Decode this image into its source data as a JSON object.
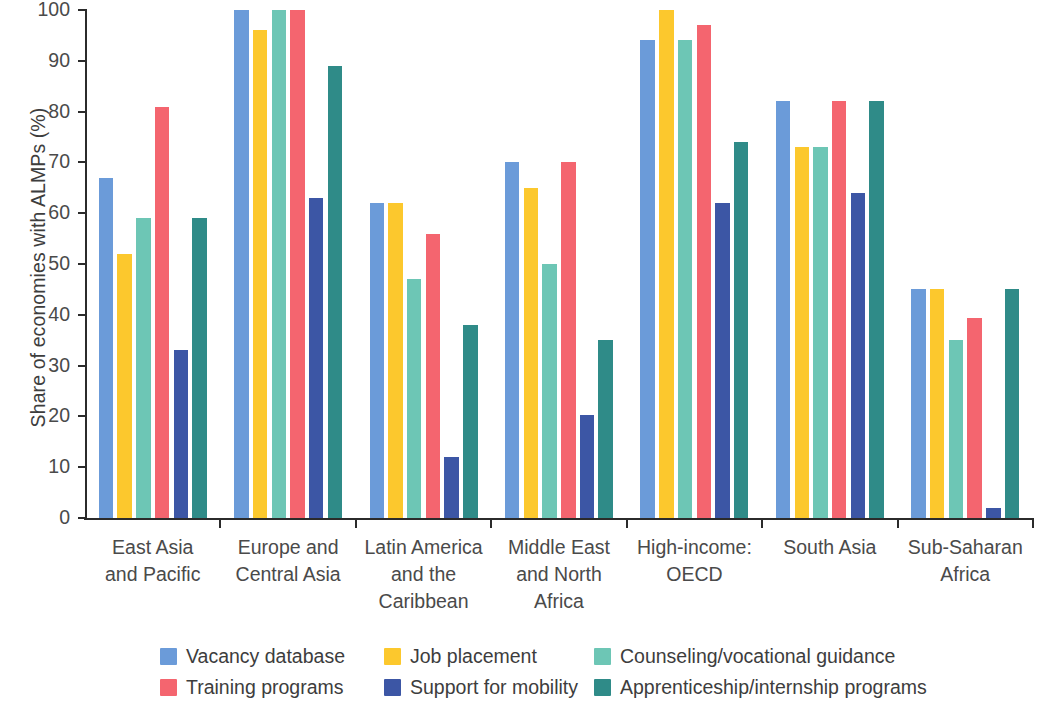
{
  "chart_data": {
    "type": "bar",
    "title": "",
    "xlabel": "",
    "ylabel": "Share of economies with ALMPs (%)",
    "ylim": [
      0,
      100
    ],
    "ytick_labels": [
      "0",
      "10",
      "20",
      "30",
      "40",
      "50",
      "60",
      "70",
      "80",
      "90",
      "100"
    ],
    "yticks": [
      0,
      10,
      20,
      30,
      40,
      50,
      60,
      70,
      80,
      90,
      100
    ],
    "grid": false,
    "legend_position": "bottom",
    "categories": [
      "East Asia and Pacific",
      "Europe and Central Asia",
      "Latin America and the Caribbean",
      "Middle East and North Africa",
      "High-income: OECD",
      "South Asia",
      "Sub-Saharan Africa"
    ],
    "category_lines": [
      [
        "East Asia",
        "and Pacific"
      ],
      [
        "Europe and",
        "Central Asia"
      ],
      [
        "Latin America",
        "and the",
        "Caribbean"
      ],
      [
        "Middle East",
        "and North",
        "Africa"
      ],
      [
        "High-income:",
        "OECD"
      ],
      [
        "South Asia"
      ],
      [
        "Sub-Saharan",
        "Africa"
      ]
    ],
    "series": [
      {
        "name": "Vacancy database",
        "color": "#6b9bd9",
        "values": [
          67,
          100,
          62,
          70,
          94,
          82,
          45
        ]
      },
      {
        "name": "Job placement",
        "color": "#fcc82d",
        "values": [
          52,
          96,
          62,
          65,
          100,
          73,
          45
        ]
      },
      {
        "name": "Counseling/vocational guidance",
        "color": "#6dc6b5",
        "values": [
          59,
          100,
          47,
          50,
          94,
          73,
          35
        ]
      },
      {
        "name": "Training programs",
        "color": "#f4656f",
        "values": [
          81,
          100,
          56,
          70,
          97,
          82,
          39.3
        ]
      },
      {
        "name": "Support for mobility",
        "color": "#3c56a5",
        "values": [
          33,
          63,
          12,
          20.3,
          62,
          64,
          2
        ]
      },
      {
        "name": "Apprenticeship/internship programs",
        "color": "#2f8b88",
        "values": [
          59,
          89,
          38,
          35,
          74,
          82,
          45
        ]
      }
    ]
  },
  "legend": {
    "items": [
      {
        "label": "Vacancy database",
        "color": "#6b9bd9"
      },
      {
        "label": "Job placement",
        "color": "#fcc82d"
      },
      {
        "label": "Counseling/vocational guidance",
        "color": "#6dc6b5"
      },
      {
        "label": "Training programs",
        "color": "#f4656f"
      },
      {
        "label": "Support for mobility",
        "color": "#3c56a5"
      },
      {
        "label": "Apprenticeship/internship programs",
        "color": "#2f8b88"
      }
    ]
  }
}
